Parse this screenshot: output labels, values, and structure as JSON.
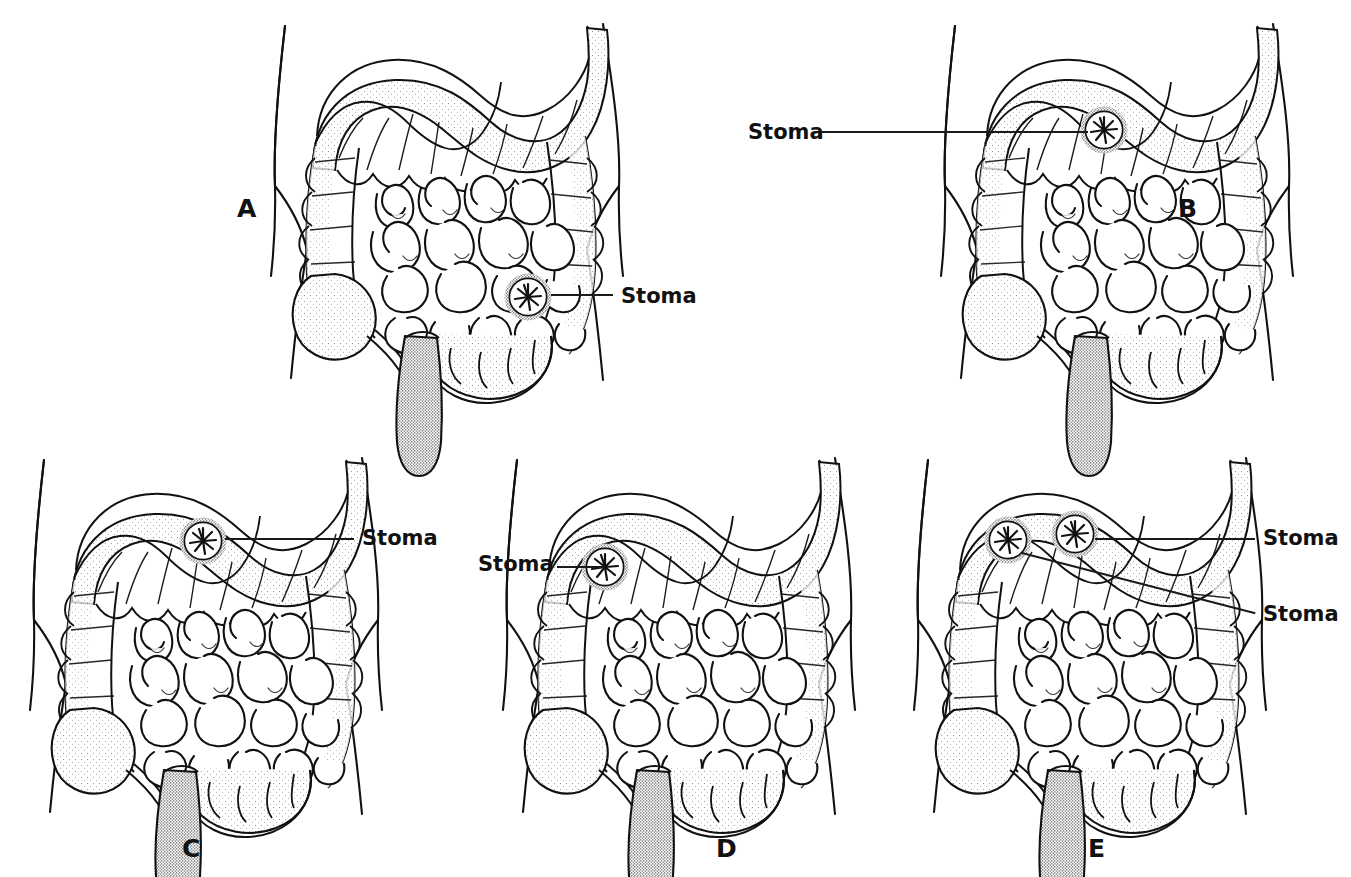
{
  "figure": {
    "background_color": "#ffffff",
    "ink_color": "#111111",
    "style": "black-and-white stippled medical line drawing",
    "panel_count": 5
  },
  "panels": [
    {
      "id": "A",
      "letter": "A",
      "letter_x": 237,
      "letter_y": 196,
      "origin_x": 255,
      "origin_y": 18,
      "description": "Sigmoid colostomy - single stoma on sigmoid colon, lower left of abdomen as drawn",
      "stomas": [
        {
          "name": "stoma-a1",
          "cx": 528,
          "cy": 297,
          "r": 20,
          "label": "Stoma",
          "label_x": 621,
          "label_y": 286,
          "leader_x1": 551,
          "leader_y1": 294,
          "leader_x2": 613,
          "leader_y2": 295
        }
      ]
    },
    {
      "id": "B",
      "letter": "B",
      "letter_x": 1178,
      "letter_y": 196,
      "origin_x": 925,
      "origin_y": 18,
      "description": "Descending colostomy - single stoma on descending colon, long horizontal leader to the left",
      "stomas": [
        {
          "name": "stoma-b1",
          "cx": 1104,
          "cy": 130,
          "r": 18,
          "label": "Stoma",
          "label_x": 748,
          "label_y": 122,
          "leader_x1": 822,
          "leader_y1": 131,
          "leader_x2": 1088,
          "leader_y2": 131
        }
      ]
    },
    {
      "id": "C",
      "letter": "C",
      "letter_x": 182,
      "letter_y": 836,
      "origin_x": 14,
      "origin_y": 452,
      "description": "Transverse colostomy - single stoma on transverse colon, leader to the right",
      "stomas": [
        {
          "name": "stoma-c1",
          "cx": 203,
          "cy": 541,
          "r": 21,
          "label": "Stoma",
          "label_x": 362,
          "label_y": 528,
          "leader_x1": 225,
          "leader_y1": 538,
          "leader_x2": 354,
          "leader_y2": 538
        }
      ]
    },
    {
      "id": "D",
      "letter": "D",
      "letter_x": 716,
      "letter_y": 836,
      "origin_x": 487,
      "origin_y": 452,
      "description": "Ascending colostomy - single stoma on ascending colon, leader to the left",
      "stomas": [
        {
          "name": "stoma-d1",
          "cx": 605,
          "cy": 567,
          "r": 20,
          "label": "Stoma",
          "label_x": 478,
          "label_y": 554,
          "leader_x1": 557,
          "leader_y1": 565,
          "leader_x2": 587,
          "leader_y2": 565
        }
      ]
    },
    {
      "id": "E",
      "letter": "E",
      "letter_x": 1088,
      "letter_y": 836,
      "origin_x": 898,
      "origin_y": 452,
      "description": "Double-barrel / loop colostomy - two stomas on transverse colon, two leaders to the right",
      "stomas": [
        {
          "name": "stoma-e1",
          "cx": 1075,
          "cy": 534,
          "r": 19,
          "label": "Stoma",
          "label_x": 1263,
          "label_y": 528,
          "leader_x1": 1095,
          "leader_y1": 538,
          "leader_x2": 1255,
          "leader_y2": 538
        },
        {
          "name": "stoma-e2",
          "cx": 1008,
          "cy": 540,
          "r": 19,
          "label": "Stoma",
          "label_x": 1263,
          "label_y": 604,
          "leader_x1": 1022,
          "leader_y1": 552,
          "leader_x2": 1255,
          "leader_y2": 614
        }
      ]
    }
  ],
  "anatomy": {
    "parts": [
      "torso-outline",
      "transverse-colon",
      "ascending-colon",
      "descending-colon",
      "sigmoid-colon",
      "rectum",
      "cecum",
      "appendix",
      "small-intestine"
    ]
  }
}
